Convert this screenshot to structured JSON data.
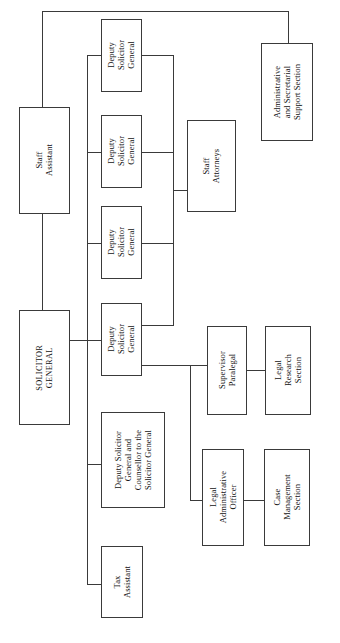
{
  "chart_title": "Office of the Solicitor General Organizational Chart",
  "orientation": "rotated-90-landscape",
  "colors": {
    "box_fill": "#ffffff",
    "box_border": "#3a3a3a",
    "text": "#111111",
    "page_background": "#ffffff"
  },
  "nodes": {
    "solicitor_general": "SOLICITOR\nGENERAL",
    "staff_assistant": "Staff\nAssistant",
    "admin_secretarial_support": "Administrative\nand Secretarial\nSupport Section",
    "deputy_1": "Deputy\nSolicitor\nGeneral",
    "deputy_2": "Deputy\nSolicitor\nGeneral",
    "deputy_3": "Deputy\nSolicitor\nGeneral",
    "deputy_4": "Deputy\nSolicitor\nGeneral",
    "staff_attorneys": "Staff\nAttorneys",
    "deputy_counsellor": "Deputy Solicitor\nGeneral and\nCounsellor to the\nSolicitor General",
    "tax_assistant": "Tax\nAssistant",
    "supervisor_paralegal": "Supervisor\nParalegal",
    "legal_research_section": "Legal\nResearch\nSection",
    "legal_administrative_officer": "Legal\nAdministrative\nOfficer",
    "case_management_section": "Case\nManagement\nSection"
  },
  "hierarchy": {
    "root": "SOLICITOR GENERAL",
    "relationships": [
      {
        "parent": "SOLICITOR GENERAL",
        "child": "Staff Assistant"
      },
      {
        "parent": "Staff Assistant",
        "child": "Administrative and Secretarial Support Section"
      },
      {
        "parent": "SOLICITOR GENERAL",
        "child": "Deputy Solicitor General (1)"
      },
      {
        "parent": "SOLICITOR GENERAL",
        "child": "Deputy Solicitor General (2)"
      },
      {
        "parent": "SOLICITOR GENERAL",
        "child": "Deputy Solicitor General (3)"
      },
      {
        "parent": "SOLICITOR GENERAL",
        "child": "Deputy Solicitor General (4)"
      },
      {
        "parent": "SOLICITOR GENERAL",
        "child": "Deputy Solicitor General and Counsellor to the Solicitor General"
      },
      {
        "parent": "SOLICITOR GENERAL",
        "child": "Tax Assistant"
      },
      {
        "parent": "Deputy Solicitor General (1-4)",
        "child": "Staff Attorneys"
      },
      {
        "parent": "Deputy Solicitor General (4)",
        "child": "Supervisor Paralegal"
      },
      {
        "parent": "Deputy Solicitor General (4)",
        "child": "Legal Administrative Officer"
      },
      {
        "parent": "Supervisor Paralegal",
        "child": "Legal Research Section"
      },
      {
        "parent": "Legal Administrative Officer",
        "child": "Case Management Section"
      }
    ]
  }
}
